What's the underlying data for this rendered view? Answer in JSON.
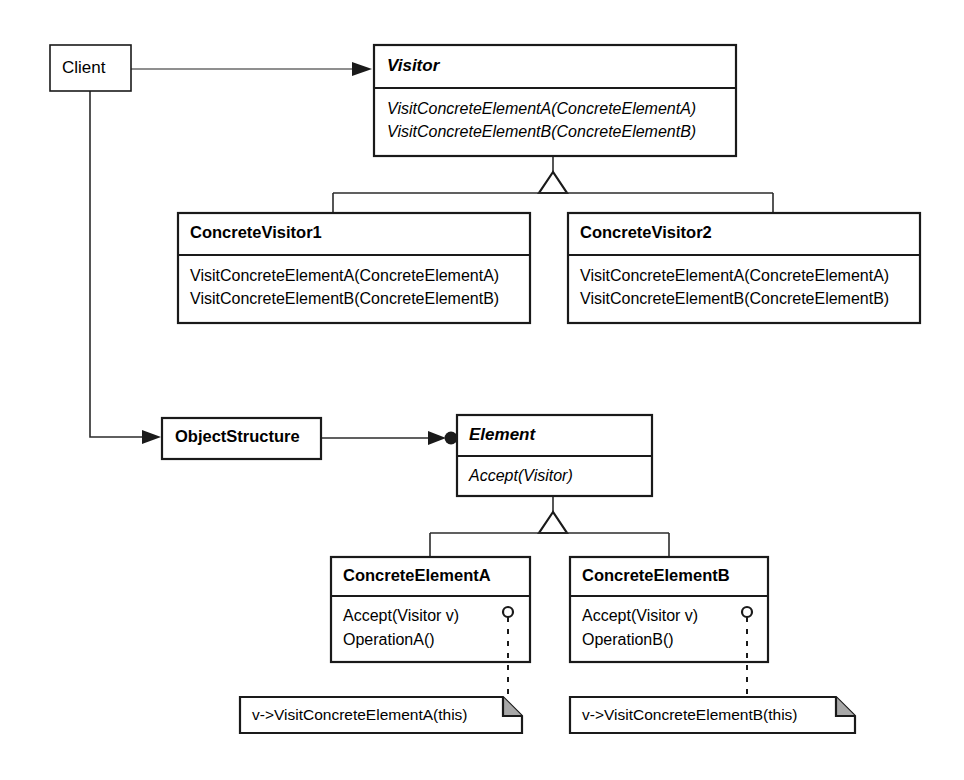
{
  "diagram": {
    "colors": {
      "stroke": "#1a1a1a",
      "connector": "#2b2b2b",
      "background": "#ffffff",
      "note_fold": "#a8a8a8"
    },
    "classes": {
      "client": {
        "name": "Client",
        "abstract": false
      },
      "visitor": {
        "name": "Visitor",
        "abstract": true,
        "methods": [
          "VisitConcreteElementA(ConcreteElementA)",
          "VisitConcreteElementB(ConcreteElementB)"
        ]
      },
      "concrete_visitor_1": {
        "name": "ConcreteVisitor1",
        "abstract": false,
        "methods": [
          "VisitConcreteElementA(ConcreteElementA)",
          "VisitConcreteElementB(ConcreteElementB)"
        ]
      },
      "concrete_visitor_2": {
        "name": "ConcreteVisitor2",
        "abstract": false,
        "methods": [
          "VisitConcreteElementA(ConcreteElementA)",
          "VisitConcreteElementB(ConcreteElementB)"
        ]
      },
      "object_structure": {
        "name": "ObjectStructure",
        "abstract": false
      },
      "element": {
        "name": "Element",
        "abstract": true,
        "methods": [
          "Accept(Visitor)"
        ]
      },
      "concrete_element_a": {
        "name": "ConcreteElementA",
        "abstract": false,
        "methods": [
          "Accept(Visitor v)",
          "OperationA()"
        ]
      },
      "concrete_element_b": {
        "name": "ConcreteElementB",
        "abstract": false,
        "methods": [
          "Accept(Visitor v)",
          "OperationB()"
        ]
      }
    },
    "notes": {
      "note_a": {
        "text": "v->VisitConcreteElementA(this)"
      },
      "note_b": {
        "text": "v->VisitConcreteElementB(this)"
      }
    },
    "relations": [
      {
        "from": "Client",
        "to": "Visitor",
        "type": "association-arrow"
      },
      {
        "from": "Client",
        "to": "ObjectStructure",
        "type": "association-arrow"
      },
      {
        "from": "ConcreteVisitor1",
        "to": "Visitor",
        "type": "generalization"
      },
      {
        "from": "ConcreteVisitor2",
        "to": "Visitor",
        "type": "generalization"
      },
      {
        "from": "ObjectStructure",
        "to": "Element",
        "type": "aggregation-arrow"
      },
      {
        "from": "ConcreteElementA",
        "to": "Element",
        "type": "generalization"
      },
      {
        "from": "ConcreteElementB",
        "to": "Element",
        "type": "generalization"
      },
      {
        "from": "ConcreteElementA.Accept",
        "to": "note_a",
        "type": "note-anchor"
      },
      {
        "from": "ConcreteElementB.Accept",
        "to": "note_b",
        "type": "note-anchor"
      }
    ]
  }
}
